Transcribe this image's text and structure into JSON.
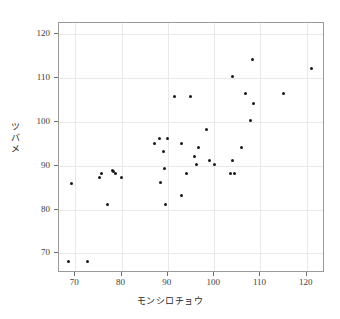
{
  "chart_data": {
    "type": "scatter",
    "title": "",
    "xlabel": "モンシロチョウ",
    "ylabel": "ツバメ",
    "xlim": [
      66.5,
      123.5
    ],
    "ylim": [
      66.0,
      122.5
    ],
    "xticks": [
      70,
      80,
      90,
      100,
      110,
      120
    ],
    "yticks": [
      70,
      80,
      90,
      100,
      110,
      120
    ],
    "xticklabels": [
      "70",
      "80",
      "90",
      "100",
      "110",
      "120"
    ],
    "yticklabels": [
      "70",
      "80",
      "90",
      "100",
      "110",
      "120"
    ],
    "grid": true,
    "legend": null,
    "marker": {
      "shape": "circle",
      "color": "#1a1a1a",
      "size": 3
    },
    "series": [
      {
        "name": "observations",
        "points": [
          [
            68.5,
            68.2
          ],
          [
            72.6,
            68.2
          ],
          [
            69.3,
            86.0
          ],
          [
            75.2,
            87.2
          ],
          [
            75.6,
            88.3
          ],
          [
            77.0,
            81.2
          ],
          [
            78.0,
            88.8
          ],
          [
            78.3,
            88.6
          ],
          [
            78.8,
            88.3
          ],
          [
            80.0,
            87.2
          ],
          [
            87.1,
            95.1
          ],
          [
            88.3,
            96.1
          ],
          [
            88.4,
            86.1
          ],
          [
            89.0,
            93.2
          ],
          [
            89.2,
            89.3
          ],
          [
            89.4,
            81.2
          ],
          [
            90.0,
            96.1
          ],
          [
            91.5,
            105.8
          ],
          [
            93.0,
            95.1
          ],
          [
            93.0,
            83.2
          ],
          [
            94.0,
            88.3
          ],
          [
            94.8,
            105.8
          ],
          [
            95.8,
            92.1
          ],
          [
            96.1,
            90.2
          ],
          [
            96.7,
            94.2
          ],
          [
            98.4,
            98.3
          ],
          [
            99.1,
            91.2
          ],
          [
            100.0,
            90.2
          ],
          [
            103.6,
            88.2
          ],
          [
            104.3,
            88.2
          ],
          [
            104.0,
            91.2
          ],
          [
            104.0,
            110.2
          ],
          [
            105.9,
            94.2
          ],
          [
            106.7,
            106.4
          ],
          [
            107.9,
            100.2
          ],
          [
            108.6,
            104.2
          ],
          [
            108.2,
            114.1
          ],
          [
            114.9,
            106.4
          ],
          [
            121.1,
            112.2
          ]
        ]
      }
    ]
  }
}
